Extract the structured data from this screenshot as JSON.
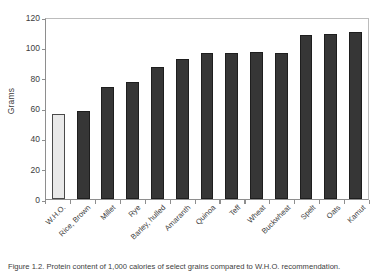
{
  "chart_data": {
    "type": "bar",
    "title": "",
    "xlabel": "",
    "ylabel": "Grams",
    "ylim": [
      0,
      120
    ],
    "yticks": [
      0,
      20,
      40,
      60,
      80,
      100,
      120
    ],
    "grid": false,
    "legend": null,
    "categories": [
      "W.H.O.",
      "Rice, Brown",
      "Millet",
      "Rye",
      "Barley, hulled",
      "Amaranth",
      "Quinoa",
      "Teff",
      "Wheat",
      "Buckwheat",
      "Spelt",
      "Oats",
      "Kamut"
    ],
    "values": [
      56,
      58,
      74,
      77,
      87,
      92,
      96,
      96,
      97,
      96,
      108,
      109,
      110
    ],
    "series": [
      {
        "name": "Grams",
        "values": [
          56,
          58,
          74,
          77,
          87,
          92,
          96,
          96,
          97,
          96,
          108,
          109,
          110
        ]
      }
    ],
    "bar_styles": [
      "light",
      "dark",
      "dark",
      "dark",
      "dark",
      "dark",
      "dark",
      "dark",
      "dark",
      "dark",
      "dark",
      "dark",
      "dark"
    ],
    "colors": {
      "reference_bar": "#e9e9e9",
      "reference_bar_edge": "#4a4a4a",
      "data_bar": "#363636",
      "data_bar_edge": "#1e1e1e",
      "axis": "#8e8e8e",
      "text": "#3d3d3d",
      "background": "#ffffff"
    }
  },
  "axes": {
    "y_title": "Grams",
    "y_tick_labels": [
      "0",
      "20",
      "40",
      "60",
      "80",
      "100",
      "120"
    ]
  },
  "caption": {
    "text": "Figure 1.2. Protein content of 1,000 calories of select grains compared to W.H.O. recommendation."
  }
}
